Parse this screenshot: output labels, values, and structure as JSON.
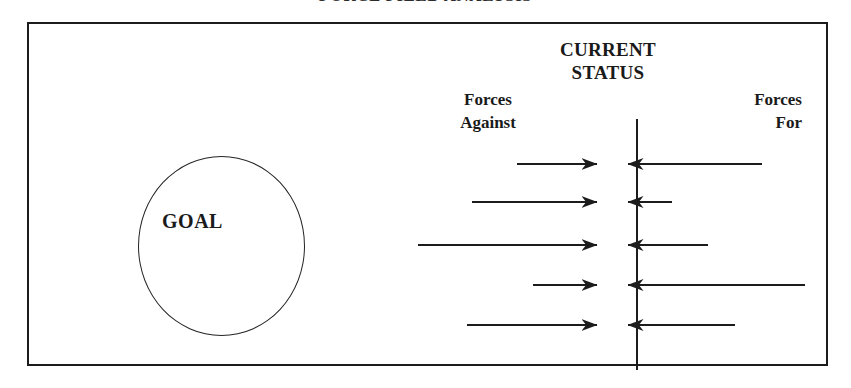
{
  "document": {
    "title": "FORCE FIELD ANALYSIS"
  },
  "diagram": {
    "goal": {
      "label": "GOAL"
    },
    "status_axis": {
      "heading_line1": "CURRENT",
      "heading_line2": "STATUS"
    },
    "left_side": {
      "label_line1": "Forces",
      "label_line2": "Against"
    },
    "right_side": {
      "label_line1": "Forces",
      "label_line2": "For"
    },
    "colors": {
      "ink": "#1c1c1c",
      "background": "#ffffff"
    }
  },
  "chart_data": {
    "type": "diagram",
    "title": "FORCE FIELD ANALYSIS",
    "axis_label": "CURRENT STATUS",
    "axis_x": 608,
    "left_group_label": "Forces Against",
    "right_group_label": "Forces For",
    "left_arrow_direction": "right",
    "right_arrow_direction": "left",
    "rows": [
      {
        "y": 164,
        "left_tail_x": 517,
        "left_tip_x": 597,
        "left_length": 80,
        "right_tip_x": 628,
        "right_tail_x": 762,
        "right_length": 134
      },
      {
        "y": 202,
        "left_tail_x": 472,
        "left_tip_x": 597,
        "left_length": 125,
        "right_tip_x": 628,
        "right_tail_x": 672,
        "right_length": 44
      },
      {
        "y": 245,
        "left_tail_x": 418,
        "left_tip_x": 597,
        "left_length": 179,
        "right_tip_x": 628,
        "right_tail_x": 708,
        "right_length": 80
      },
      {
        "y": 285,
        "left_tail_x": 533,
        "left_tip_x": 597,
        "left_length": 64,
        "right_tip_x": 628,
        "right_tail_x": 805,
        "right_length": 177
      },
      {
        "y": 325,
        "left_tail_x": 467,
        "left_tip_x": 597,
        "left_length": 130,
        "right_tip_x": 628,
        "right_tail_x": 735,
        "right_length": 107
      }
    ]
  }
}
